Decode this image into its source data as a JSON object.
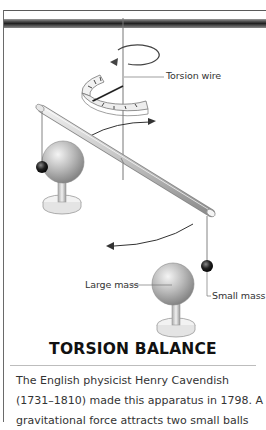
{
  "illustration": {
    "labels": {
      "torsion_wire": "Torsion wire",
      "large_mass": "Large mass",
      "small_mass": "Small mass"
    },
    "icons": [
      "rotation-arrow-icon",
      "scale-dial",
      "rod",
      "large-sphere",
      "small-sphere",
      "curved-arrow-icon"
    ]
  },
  "section": {
    "title": "TORSION BALANCE",
    "body_lines": [
      "The English physicist Henry Cavendish",
      "(1731–1810) made this apparatus in 1798. A",
      "gravitational force attracts two small balls"
    ]
  },
  "colors": {
    "frame": "#5a5a5a",
    "title": "#111111",
    "text": "#333333"
  }
}
